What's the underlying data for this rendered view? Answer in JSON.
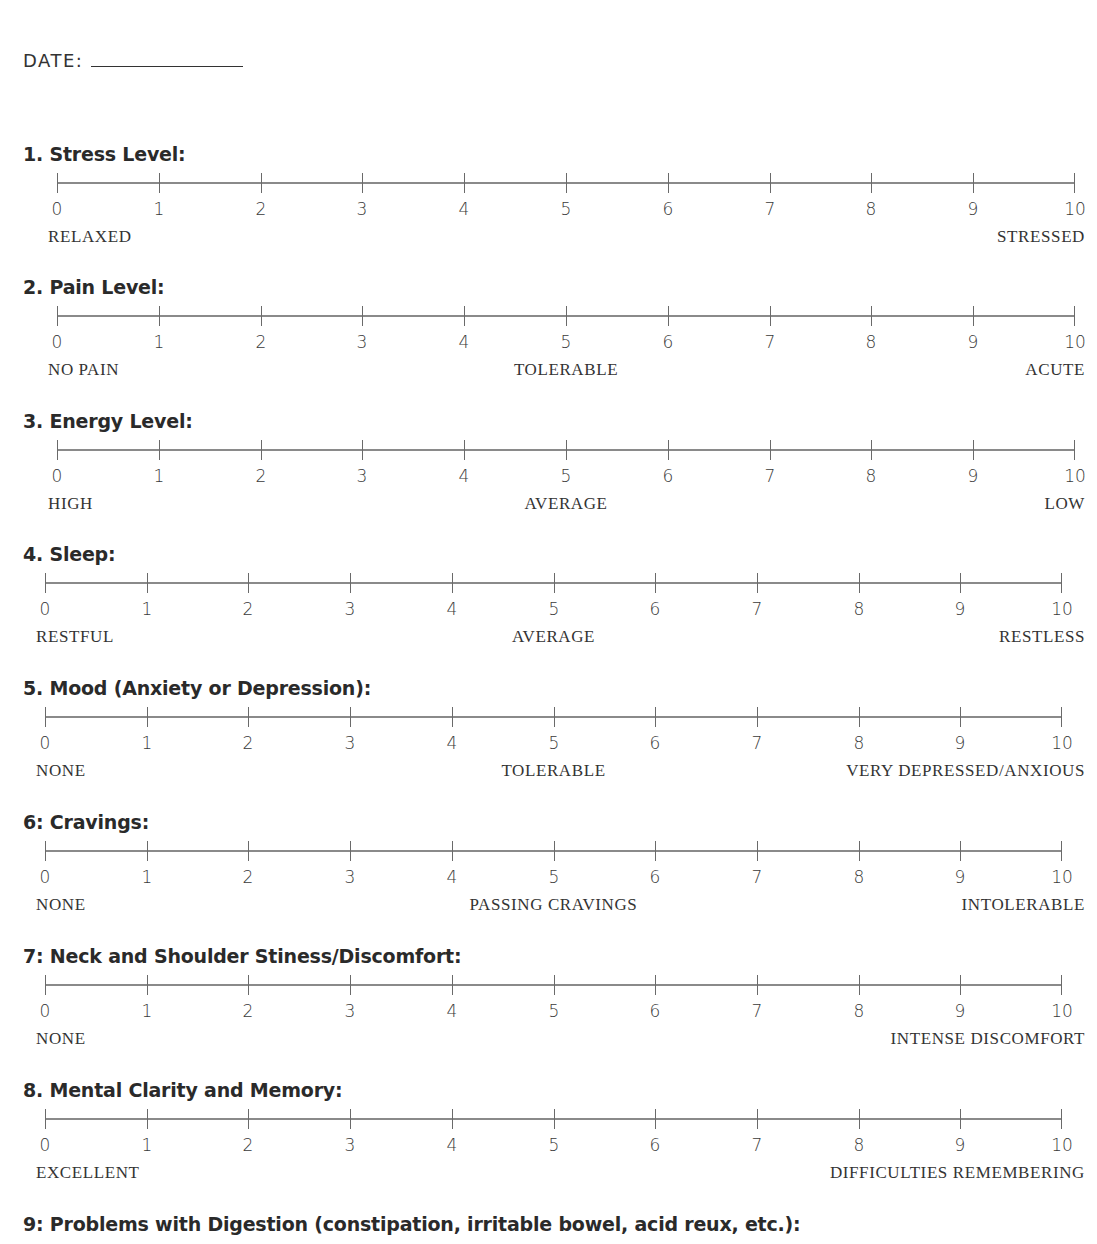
{
  "header": {
    "date_label": "DATE:",
    "date_value": ""
  },
  "scale_numbers": [
    "0",
    "1",
    "2",
    "3",
    "4",
    "5",
    "6",
    "7",
    "8",
    "9",
    "10"
  ],
  "sections": [
    {
      "title": "1. Stress Level:",
      "left": "RELAXED",
      "middle": "",
      "right": "STRESSED"
    },
    {
      "title": "2. Pain Level:",
      "left": "NO PAIN",
      "middle": "TOLERABLE",
      "right": "ACUTE"
    },
    {
      "title": "3. Energy Level:",
      "left": "HIGH",
      "middle": "AVERAGE",
      "right": "LOW"
    },
    {
      "title": "4. Sleep:",
      "left": "RESTFUL",
      "middle": "AVERAGE",
      "right": "RESTLESS"
    },
    {
      "title": "5. Mood (Anxiety or Depression):",
      "left": "NONE",
      "middle": "TOLERABLE",
      "right": "VERY DEPRESSED/ANXIOUS"
    },
    {
      "title": "6: Cravings:",
      "left": "NONE",
      "middle": "PASSING CRAVINGS",
      "right": "INTOLERABLE"
    },
    {
      "title": "7: Neck and Shoulder Stiness/Discomfort:",
      "left": "NONE",
      "middle": "",
      "right": "INTENSE DISCOMFORT"
    },
    {
      "title": "8. Mental Clarity and Memory:",
      "left": "EXCELLENT",
      "middle": "",
      "right": "DIFFICULTIES REMEMBERING"
    },
    {
      "title": "9: Problems with Digestion (constipation, irritable bowel, acid reux, etc.):"
    }
  ]
}
